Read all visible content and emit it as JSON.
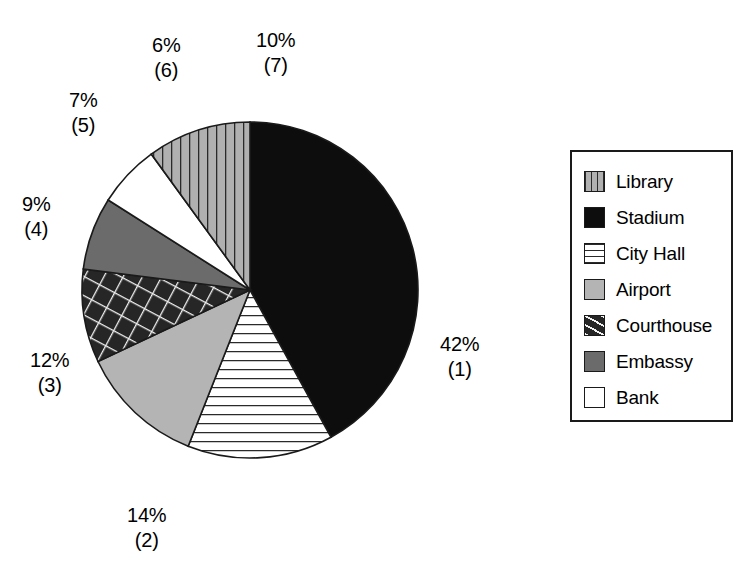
{
  "chart_data": {
    "type": "pie",
    "title": "",
    "legend_position": "right",
    "categories": [
      "Library",
      "Stadium",
      "City Hall",
      "Airport",
      "Courthouse",
      "Embassy",
      "Bank"
    ],
    "values": [
      10,
      42,
      14,
      12,
      9,
      7,
      6
    ],
    "labels": [
      "10%",
      "42%",
      "14%",
      "12%",
      "9%",
      "7%",
      "6%"
    ],
    "rank_labels": [
      "(7)",
      "(1)",
      "(2)",
      "(3)",
      "(4)",
      "(5)",
      "(6)"
    ],
    "units": "percent",
    "slices": [
      {
        "name": "Stadium",
        "value": 42,
        "pct_label": "42%",
        "rank_label": "(1)",
        "fill": "#0d0d0d",
        "pattern": "solid",
        "start_angle": 0,
        "end_angle": 151.2,
        "label_x": 440,
        "label_y": 332
      },
      {
        "name": "City Hall",
        "value": 14,
        "pct_label": "14%",
        "rank_label": "(2)",
        "fill": "#ffffff",
        "pattern": "horizontal-lines",
        "start_angle": 151.2,
        "end_angle": 201.6,
        "label_x": 127,
        "label_y": 503
      },
      {
        "name": "Airport",
        "value": 12,
        "pct_label": "12%",
        "rank_label": "(3)",
        "fill": "#b4b4b4",
        "pattern": "solid",
        "start_angle": 201.6,
        "end_angle": 244.8,
        "label_x": 30,
        "label_y": 348
      },
      {
        "name": "Courthouse",
        "value": 9,
        "pct_label": "9%",
        "rank_label": "(4)",
        "fill": "#262626",
        "pattern": "cross-hatch",
        "start_angle": 244.8,
        "end_angle": 277.2,
        "label_x": 22,
        "label_y": 192
      },
      {
        "name": "Embassy",
        "value": 7,
        "pct_label": "7%",
        "rank_label": "(5)",
        "fill": "#6b6b6b",
        "pattern": "solid",
        "start_angle": 277.2,
        "end_angle": 302.4,
        "label_x": 69,
        "label_y": 88
      },
      {
        "name": "Bank",
        "value": 6,
        "pct_label": "6%",
        "rank_label": "(6)",
        "fill": "#ffffff",
        "pattern": "solid",
        "start_angle": 302.4,
        "end_angle": 324.0,
        "label_x": 152,
        "label_y": 33
      },
      {
        "name": "Library",
        "value": 10,
        "pct_label": "10%",
        "rank_label": "(7)",
        "fill": "#b0b0b0",
        "pattern": "vertical-lines",
        "start_angle": 324.0,
        "end_angle": 360,
        "label_x": 256,
        "label_y": 28
      }
    ],
    "geometry": {
      "center_x": 250,
      "center_y": 290,
      "radius": 168,
      "start_at_12_oclock": true,
      "direction": "clockwise"
    }
  },
  "legend": {
    "items": [
      {
        "label": "Library",
        "fill": "#b0b0b0",
        "pattern": "vertical-lines",
        "swatch_name": "legend-swatch-library"
      },
      {
        "label": "Stadium",
        "fill": "#0d0d0d",
        "pattern": "solid",
        "swatch_name": "legend-swatch-stadium"
      },
      {
        "label": "City Hall",
        "fill": "#ffffff",
        "pattern": "horizontal-lines",
        "swatch_name": "legend-swatch-city-hall"
      },
      {
        "label": "Airport",
        "fill": "#b4b4b4",
        "pattern": "solid",
        "swatch_name": "legend-swatch-airport"
      },
      {
        "label": "Courthouse",
        "fill": "#262626",
        "pattern": "cross-hatch",
        "swatch_name": "legend-swatch-courthouse"
      },
      {
        "label": "Embassy",
        "fill": "#6b6b6b",
        "pattern": "solid",
        "swatch_name": "legend-swatch-embassy"
      },
      {
        "label": "Bank",
        "fill": "#ffffff",
        "pattern": "solid",
        "swatch_name": "legend-swatch-bank"
      }
    ]
  },
  "colors": {
    "outline": "#1a1a1a",
    "background": "#ffffff",
    "text": "#000000"
  }
}
